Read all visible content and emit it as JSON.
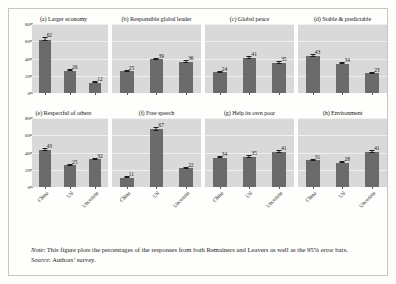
{
  "figure": {
    "categories": [
      "China",
      "US",
      "Uncertain"
    ],
    "y_ticks": [
      "80",
      "60",
      "40",
      "20",
      "0"
    ],
    "note_label": "Note",
    "note_text": ": This figure plots the percentages of the responses from both Remainers and Leavers as well as the 95% error bars.",
    "source_label": "Source",
    "source_text": ": Authors’ survey."
  },
  "chart_data": {
    "type": "bar",
    "title": "",
    "xlabel": "",
    "ylabel": "",
    "ylim": [
      0,
      80
    ],
    "yticks": [
      0,
      20,
      40,
      60,
      80
    ],
    "grid": true,
    "legend": "none",
    "categories": [
      "China",
      "US",
      "Uncertain"
    ],
    "panels": [
      {
        "id": "a",
        "title": "(a) Larger economy",
        "values": [
          62,
          26,
          12
        ],
        "errors": [
          2,
          2,
          2
        ]
      },
      {
        "id": "b",
        "title": "(b) Responsible global leader",
        "values": [
          25,
          39,
          36
        ],
        "errors": [
          2,
          2,
          2
        ]
      },
      {
        "id": "c",
        "title": "(c) Global peace",
        "values": [
          24,
          41,
          35
        ],
        "errors": [
          2,
          2,
          2
        ]
      },
      {
        "id": "d",
        "title": "(d) Stable & predictable",
        "values": [
          43,
          34,
          23
        ],
        "errors": [
          2,
          2,
          2
        ]
      },
      {
        "id": "e",
        "title": "(e) Respectful of others",
        "values": [
          43,
          25,
          32
        ],
        "errors": [
          2,
          2,
          2
        ]
      },
      {
        "id": "f",
        "title": "(f) Free speech",
        "values": [
          11,
          67,
          22
        ],
        "errors": [
          2,
          2,
          2
        ]
      },
      {
        "id": "g",
        "title": "(g) Help its own poor",
        "values": [
          34,
          35,
          41
        ],
        "errors": [
          2,
          2,
          2
        ]
      },
      {
        "id": "h",
        "title": "(h) Environment",
        "values": [
          31,
          28,
          41
        ],
        "errors": [
          2,
          2,
          2
        ]
      }
    ],
    "colors": {
      "bar": "#6b6b6b",
      "plot_background": "#d9d9d9",
      "gridline": "#f0f0f0",
      "error_bar": "#1c1c1c"
    }
  }
}
